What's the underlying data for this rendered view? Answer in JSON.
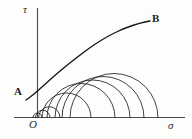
{
  "figure": {
    "name": "mohr-circle-failure-envelope",
    "caption": "Mohr circles with common tangent failure envelope in the sigma-tau plane",
    "background_color": "#fdfdfb",
    "stroke_color": "#1f1f1f",
    "axis_color": "#4a4a4a"
  },
  "axes": {
    "vertical": {
      "label": "τ",
      "name": "shear-stress-axis",
      "x": 37.5,
      "y_top": 8,
      "y_bottom": 118
    },
    "horizontal": {
      "label": "σ",
      "name": "normal-stress-axis",
      "y": 117.5,
      "x_left": 14,
      "x_right": 185
    },
    "origin": {
      "label": "O",
      "x": 37.5,
      "y": 117.5
    }
  },
  "labels": {
    "tau": "τ",
    "sigma": "σ",
    "origin": "O",
    "envelope_start": "A",
    "envelope_end": "B"
  },
  "chart_data": {
    "type": "line",
    "title": "",
    "xlabel": "σ",
    "ylabel": "τ",
    "xlim": [
      14,
      185
    ],
    "ylim": [
      8,
      117.5
    ],
    "grid": false,
    "legend": "none",
    "annotations": [
      {
        "text": "A",
        "x": 18,
        "y": 91,
        "role": "envelope-left-endpoint"
      },
      {
        "text": "B",
        "x": 155,
        "y": 18,
        "role": "envelope-right-endpoint"
      },
      {
        "text": "O",
        "x": 33,
        "y": 124,
        "role": "origin"
      },
      {
        "text": "τ",
        "x": 27,
        "y": 10,
        "role": "y-axis-label"
      },
      {
        "text": "σ",
        "x": 172,
        "y": 126,
        "role": "x-axis-label"
      }
    ],
    "series": [
      {
        "name": "failure-envelope",
        "kind": "envelope-curve",
        "points": [
          [
            26,
            100
          ],
          [
            33,
            95
          ],
          [
            42,
            87
          ],
          [
            53,
            77
          ],
          [
            66,
            66
          ],
          [
            80,
            55
          ],
          [
            95,
            44
          ],
          [
            110,
            35
          ],
          [
            125,
            28
          ],
          [
            140,
            23
          ],
          [
            150,
            21
          ]
        ]
      }
    ],
    "circles": [
      {
        "name": "mohr-circle-1",
        "left": 33.0,
        "right": 42.0,
        "center_x": 37.5,
        "radius": 4.5
      },
      {
        "name": "mohr-circle-2",
        "left": 35.5,
        "right": 50.0,
        "center_x": 42.75,
        "radius": 7.25
      },
      {
        "name": "mohr-circle-3",
        "left": 38.5,
        "right": 60.0,
        "center_x": 49.25,
        "radius": 10.75
      },
      {
        "name": "mohr-circle-4",
        "left": 42.0,
        "right": 91.0,
        "center_x": 66.5,
        "radius": 24.5
      },
      {
        "name": "mohr-circle-5",
        "left": 47.0,
        "right": 115.0,
        "center_x": 81.0,
        "radius": 34.0
      },
      {
        "name": "mohr-circle-6",
        "left": 55.0,
        "right": 130.0,
        "center_x": 92.5,
        "radius": 37.5
      },
      {
        "name": "mohr-circle-7",
        "left": 62.0,
        "right": 144.0,
        "center_x": 103.0,
        "radius": 41.0
      },
      {
        "name": "mohr-circle-8",
        "left": 70.0,
        "right": 158.0,
        "center_x": 114.0,
        "radius": 44.0
      }
    ]
  }
}
